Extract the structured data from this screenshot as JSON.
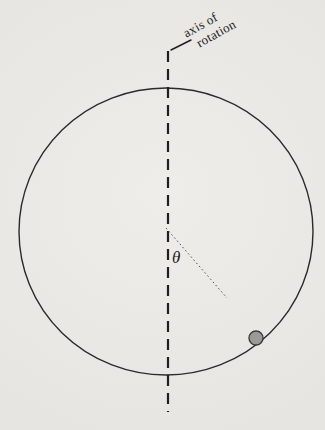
{
  "figure": {
    "axis_label_line1": "axis of",
    "axis_label_line2": "rotation",
    "theta_symbol": "θ",
    "colors": {
      "background": "#e9e7e3",
      "circle_stroke": "#2b2b2b",
      "axis_dashed_line": "#1f1f1f",
      "radius_dotted_line": "#555450",
      "ball_fill": "#9b9a97",
      "ball_stroke": "#3c3c3a",
      "text": "#1c1c1c"
    }
  }
}
